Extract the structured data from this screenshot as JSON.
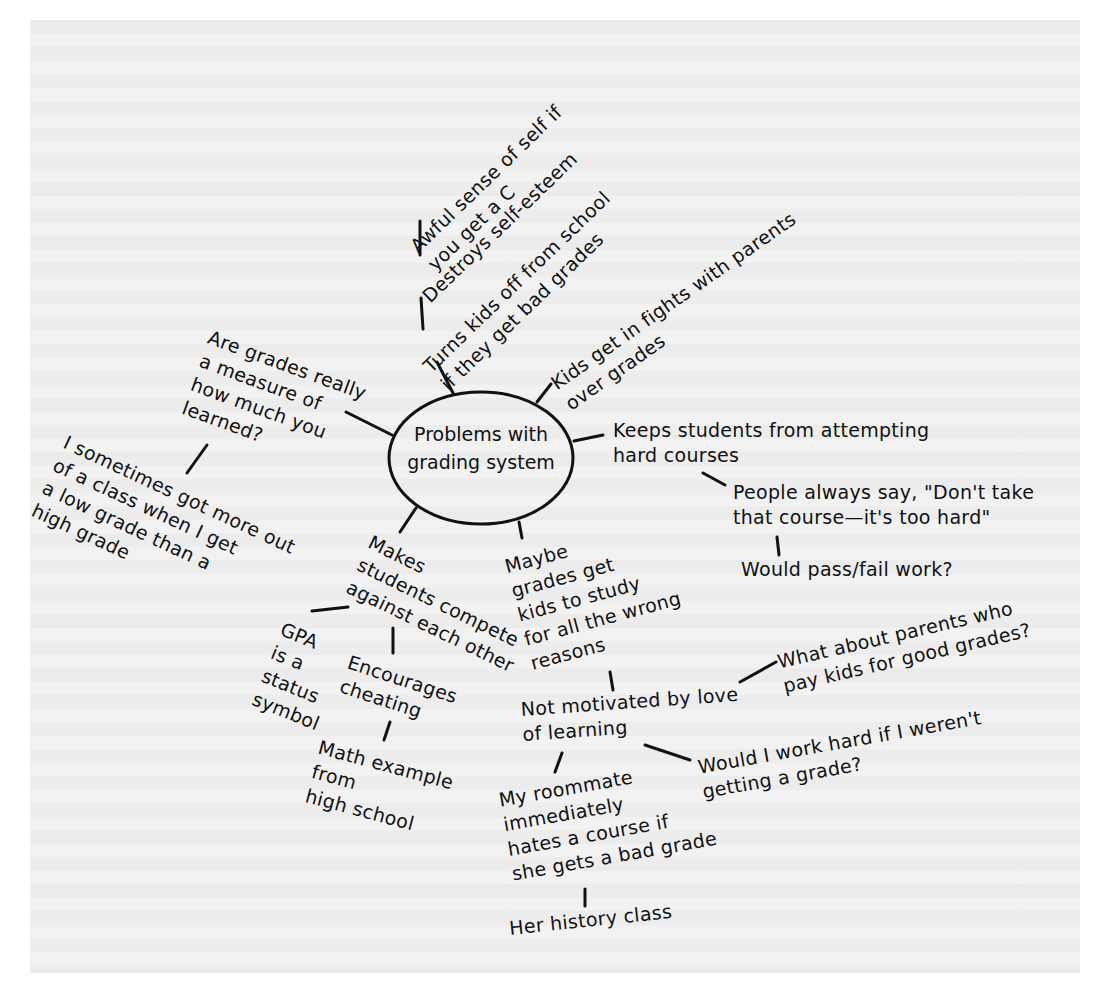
{
  "diagram": {
    "type": "mind-map",
    "center": {
      "id": "root",
      "label": "Problems with\ngrading system"
    },
    "nodes": [
      {
        "id": "awful",
        "label": "Awful sense of self if\nyou get a C",
        "parent": "destroys"
      },
      {
        "id": "destroys",
        "label": "Destroys self-esteem",
        "parent": "turns"
      },
      {
        "id": "turns",
        "label": "Turns kids off from school\nif they get bad grades",
        "parent": "root"
      },
      {
        "id": "fights",
        "label": "Kids get in fights with parents\nover grades",
        "parent": "root"
      },
      {
        "id": "measure",
        "label": "Are grades really\na measure of\nhow much you\nlearned?",
        "parent": "root"
      },
      {
        "id": "sometimes",
        "label": "I sometimes got more out\nof a class when I get\na low grade than a\nhigh grade",
        "parent": "measure"
      },
      {
        "id": "keeps",
        "label": "Keeps students from attempting\nhard courses",
        "parent": "root"
      },
      {
        "id": "people",
        "label": "People always say, \"Don't take\nthat course—it's too hard\"",
        "parent": "keeps"
      },
      {
        "id": "passfail",
        "label": "Would pass/fail work?",
        "parent": "people"
      },
      {
        "id": "compete",
        "label": "Makes\nstudents compete\nagainst each other",
        "parent": "root"
      },
      {
        "id": "gpa",
        "label": "GPA\nis a\nstatus\nsymbol",
        "parent": "compete"
      },
      {
        "id": "cheating",
        "label": "Encourages\ncheating",
        "parent": "compete"
      },
      {
        "id": "math",
        "label": "Math example\nfrom\nhigh school",
        "parent": "cheating"
      },
      {
        "id": "maybe",
        "label": "Maybe\ngrades get\nkids to study\nfor all the wrong\nreasons",
        "parent": "root"
      },
      {
        "id": "notmotivated",
        "label": "Not motivated by love\nof learning",
        "parent": "maybe"
      },
      {
        "id": "whatabout",
        "label": "What about parents who\npay kids for good grades?",
        "parent": "notmotivated"
      },
      {
        "id": "wouldi",
        "label": "Would I work hard if I weren't\ngetting a grade?",
        "parent": "notmotivated"
      },
      {
        "id": "roommate",
        "label": "My roommate\nimmediately\nhates a course if\nshe gets a bad grade",
        "parent": "notmotivated"
      },
      {
        "id": "history",
        "label": "Her history class",
        "parent": "roommate"
      }
    ]
  },
  "colors": {
    "ink": "#111111",
    "page": "#f2f2f2",
    "margin": "#ffffff"
  }
}
